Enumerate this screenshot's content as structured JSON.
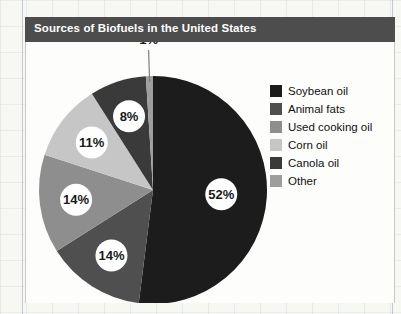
{
  "chart_title": "Sources of Biofuels in the United States",
  "colors": {
    "title_bar_bg": "#4d4d4d",
    "title_text": "#ffffff",
    "panel_bg": "#fdfdfc",
    "label_text": "#1a1a1a"
  },
  "legend": {
    "items": [
      {
        "label": "Soybean oil",
        "color": "#1c1c1c"
      },
      {
        "label": "Animal fats",
        "color": "#4f4f4f"
      },
      {
        "label": "Used cooking oil",
        "color": "#8e8e8e"
      },
      {
        "label": "Corn oil",
        "color": "#c6c6c6"
      },
      {
        "label": "Canola oil",
        "color": "#3a3a3a"
      },
      {
        "label": "Other",
        "color": "#9e9e9e"
      }
    ]
  },
  "chart_data": {
    "type": "pie",
    "title": "Sources of Biofuels in the United States",
    "xlabel": "",
    "ylabel": "",
    "legend_position": "right",
    "grid": false,
    "units": "percent",
    "start_angle_deg": 0,
    "direction": "clockwise",
    "categories": [
      "Soybean oil",
      "Animal fats",
      "Used cooking oil",
      "Corn oil",
      "Canola oil",
      "Other"
    ],
    "values": [
      52,
      14,
      14,
      11,
      8,
      1
    ],
    "slices": [
      {
        "name": "Soybean oil",
        "value": 52,
        "label": "52%",
        "color": "#1c1c1c",
        "label_placement": "inside"
      },
      {
        "name": "Animal fats",
        "value": 14,
        "label": "14%",
        "color": "#4f4f4f",
        "label_placement": "inside"
      },
      {
        "name": "Used cooking oil",
        "value": 14,
        "label": "14%",
        "color": "#8e8e8e",
        "label_placement": "inside"
      },
      {
        "name": "Corn oil",
        "value": 11,
        "label": "11%",
        "color": "#c6c6c6",
        "label_placement": "inside"
      },
      {
        "name": "Canola oil",
        "value": 8,
        "label": "8%",
        "color": "#3a3a3a",
        "label_placement": "inside"
      },
      {
        "name": "Other",
        "value": 1,
        "label": "1%",
        "color": "#9e9e9e",
        "label_placement": "callout"
      }
    ],
    "data_labels": [
      "52%",
      "14%",
      "14%",
      "11%",
      "8%",
      "1%"
    ]
  }
}
